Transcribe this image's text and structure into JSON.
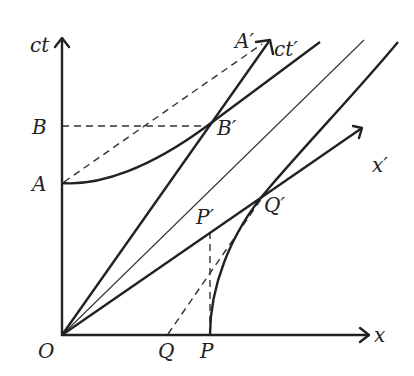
{
  "diagram": {
    "labels": {
      "ct": "ct",
      "x": "x",
      "ct_prime": "ct′",
      "x_prime": "x′",
      "origin": "O",
      "A": "A",
      "B": "B",
      "A_prime": "A′",
      "B_prime": "B′",
      "P": "P",
      "Q": "Q",
      "P_prime": "P′",
      "Q_prime": "Q′"
    },
    "elements": [
      "ct-axis",
      "x-axis",
      "ct-prime-axis",
      "x-prime-axis",
      "light-cone-line",
      "timelike-hyperbola-through-A-and-B-prime",
      "spacelike-hyperbola-through-P-and-Q-prime",
      "dashed-B-to-B-prime",
      "dashed-A-to-A-prime",
      "dashed-P-prime-to-P",
      "dashed-Q-to-Q-prime"
    ],
    "colors": {
      "stroke": "#222222",
      "background": "#ffffff"
    }
  }
}
